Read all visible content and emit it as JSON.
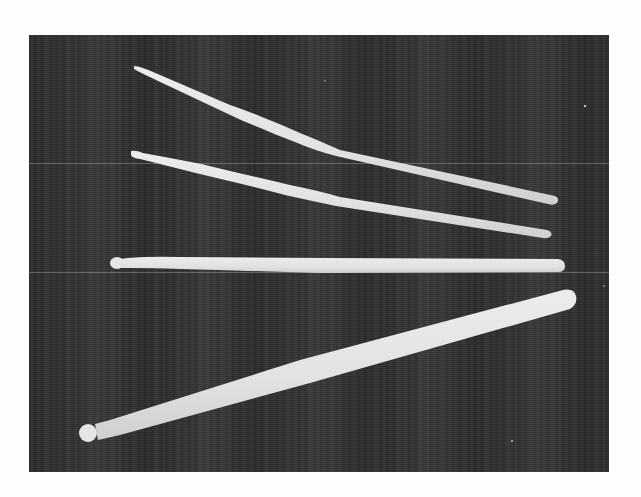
{
  "image": {
    "description": "Black-and-white photograph of four drumsticks arranged in a fan on a dark striped cloth background",
    "width": 641,
    "height": 497,
    "page_background": "#fdfdfd",
    "frame": {
      "x": 29,
      "y": 35,
      "width": 580,
      "height": 437,
      "color": "#2e2e2e"
    },
    "stick_color": "#e4e4e4",
    "scanlines_y": [
      163,
      272,
      210
    ]
  },
  "sticks": [
    {
      "name": "stick-1-thin-top",
      "tip": [
        136,
        67
      ],
      "butt": [
        555,
        200
      ],
      "tip_width": 3,
      "mid_width": 10,
      "butt_width": 8
    },
    {
      "name": "stick-2-thin",
      "tip": [
        131,
        153
      ],
      "butt": [
        549,
        233
      ],
      "tip_width": 5,
      "mid_width": 10,
      "butt_width": 8
    },
    {
      "name": "stick-3-medium-horizontal",
      "tip": [
        116,
        263
      ],
      "butt": [
        561,
        266
      ],
      "tip_width": 12,
      "mid_width": 14,
      "butt_width": 14
    },
    {
      "name": "stick-4-thick-bottom",
      "tip": [
        88,
        430
      ],
      "butt": [
        570,
        300
      ],
      "tip_width": 16,
      "mid_width": 22,
      "butt_width": 28
    }
  ]
}
